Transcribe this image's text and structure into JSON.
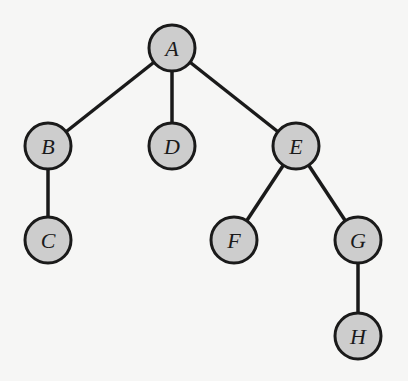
{
  "diagram": {
    "type": "tree",
    "colors": {
      "background": "#f6f6f5",
      "node_fill": "#cdcdcd",
      "node_stroke": "#1a1a1a",
      "edge": "#1a1a1a"
    },
    "nodes": [
      {
        "id": "A",
        "label": "A",
        "x": 172,
        "y": 48
      },
      {
        "id": "B",
        "label": "B",
        "x": 48,
        "y": 146
      },
      {
        "id": "D",
        "label": "D",
        "x": 172,
        "y": 146
      },
      {
        "id": "E",
        "label": "E",
        "x": 296,
        "y": 146
      },
      {
        "id": "C",
        "label": "C",
        "x": 48,
        "y": 240
      },
      {
        "id": "F",
        "label": "F",
        "x": 234,
        "y": 240
      },
      {
        "id": "G",
        "label": "G",
        "x": 358,
        "y": 240
      },
      {
        "id": "H",
        "label": "H",
        "x": 358,
        "y": 336
      }
    ],
    "edges": [
      {
        "from": "A",
        "to": "B"
      },
      {
        "from": "A",
        "to": "D"
      },
      {
        "from": "A",
        "to": "E"
      },
      {
        "from": "B",
        "to": "C"
      },
      {
        "from": "E",
        "to": "F"
      },
      {
        "from": "E",
        "to": "G"
      },
      {
        "from": "G",
        "to": "H"
      }
    ]
  }
}
